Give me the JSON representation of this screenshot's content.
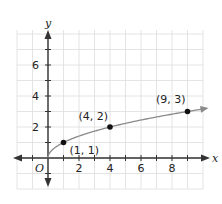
{
  "chart_data": {
    "type": "line",
    "title": "",
    "function": "y = sqrt(x)",
    "xlabel": "x",
    "ylabel": "y",
    "origin_label": "O",
    "xlim": [
      -2,
      10
    ],
    "ylim": [
      -2,
      8
    ],
    "x_ticks": [
      2,
      4,
      6,
      8
    ],
    "y_ticks": [
      2,
      4,
      6
    ],
    "grid": true,
    "series": [
      {
        "name": "y = sqrt(x)",
        "color": "#8a8a8a",
        "points": [
          {
            "x": 1,
            "y": 1,
            "label": "(1, 1)"
          },
          {
            "x": 4,
            "y": 2,
            "label": "(4, 2)"
          },
          {
            "x": 9,
            "y": 3,
            "label": "(9, 3)"
          }
        ]
      }
    ]
  },
  "colors": {
    "axis": "#333333",
    "grid": "#dddddd",
    "curve": "#8a8a8a",
    "point": "#111111"
  }
}
